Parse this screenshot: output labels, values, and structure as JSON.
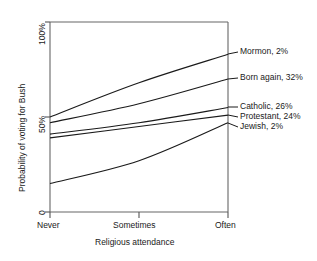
{
  "chart_data": {
    "type": "line",
    "title": "",
    "xlabel": "Religious attendance",
    "ylabel": "Probability of voting for Bush",
    "x_ticklabels": [
      "Never",
      "Sometimes",
      "Often"
    ],
    "x": [
      0,
      1,
      2
    ],
    "y_ticklabels": [
      "0",
      "50%",
      "100%"
    ],
    "y_ticks": [
      0,
      50,
      100
    ],
    "ylim": [
      0,
      100
    ],
    "xlim": [
      0,
      2
    ],
    "grid": false,
    "legend_position": "right-of-axes-with-leader-lines",
    "series": [
      {
        "name": "Mormon, 2%",
        "label": "Mormon, 2%",
        "values": [
          50,
          68,
          83
        ]
      },
      {
        "name": "Born again, 32%",
        "label": "Born again, 32%",
        "values": [
          47,
          57,
          70
        ]
      },
      {
        "name": "Catholic, 26%",
        "label": "Catholic, 26%",
        "values": [
          41,
          47,
          55
        ]
      },
      {
        "name": "Protestant, 24%",
        "label": "Protestant, 24%",
        "values": [
          39,
          45,
          51
        ]
      },
      {
        "name": "Jewish, 2%",
        "label": "Jewish, 2%",
        "values": [
          15,
          27,
          47
        ]
      }
    ],
    "axis_color": "#555555",
    "line_color": "#1a1a1a"
  },
  "axes": {
    "y_tick_top": "100%",
    "y_tick_mid": "50%",
    "y_tick_bottom": "0",
    "x_tick_left": "Never",
    "x_tick_mid": "Sometimes",
    "x_tick_right": "Often",
    "x_title": "Religious attendance",
    "y_title": "Probability of voting for Bush"
  },
  "labels": {
    "mormon": "Mormon, 2%",
    "born_again": "Born again, 32%",
    "catholic": "Catholic, 26%",
    "protestant": "Protestant, 24%",
    "jewish": "Jewish, 2%"
  }
}
